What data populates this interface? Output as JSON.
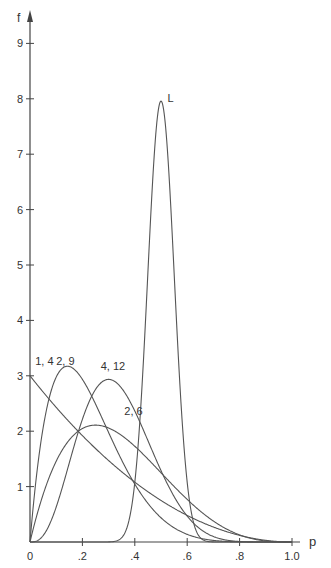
{
  "chart_data": {
    "type": "line",
    "title": "",
    "xlabel": "p",
    "ylabel": "f",
    "xlim": [
      0,
      1.0
    ],
    "ylim": [
      0,
      9.5
    ],
    "grid": false,
    "legend": "inline labels",
    "x_ticks": [
      0,
      0.2,
      0.4,
      0.6,
      0.8,
      1.0
    ],
    "x_tick_labels": [
      "0",
      ".2",
      ".4",
      ".6",
      ".8",
      "1.0"
    ],
    "y_ticks": [
      1,
      2,
      3,
      4,
      5,
      6,
      7,
      8,
      9
    ],
    "y_tick_labels": [
      "1",
      "2",
      "3",
      "4",
      "5",
      "6",
      "7",
      "8",
      "9"
    ],
    "series": [
      {
        "name": "1, 4",
        "distribution": "beta",
        "alpha": 1,
        "beta": 3,
        "label_pos": [
          0.02,
          3.2
        ],
        "x": [
          0,
          0.1,
          0.2,
          0.3,
          0.4,
          0.5,
          0.6,
          0.7,
          0.8,
          0.9,
          1.0
        ],
        "values": [
          3.0,
          2.43,
          1.92,
          1.47,
          1.08,
          0.75,
          0.48,
          0.27,
          0.12,
          0.03,
          0
        ]
      },
      {
        "name": "2, 9",
        "distribution": "beta",
        "alpha": 2,
        "beta": 7,
        "label_pos": [
          0.1,
          3.2
        ],
        "x": [
          0,
          0.1,
          0.2,
          0.3,
          0.4,
          0.5,
          0.6,
          0.7,
          0.8
        ],
        "values": [
          0,
          3.02,
          2.1,
          0.94,
          0.3,
          0.06,
          0.01,
          0,
          0
        ]
      },
      {
        "name": "4, 12",
        "distribution": "beta",
        "alpha": 4,
        "beta": 8,
        "label_pos": [
          0.27,
          3.1
        ],
        "x": [
          0,
          0.1,
          0.2,
          0.3,
          0.4,
          0.5,
          0.6,
          0.7,
          0.8
        ],
        "values": [
          0,
          0.63,
          2.21,
          2.93,
          2.21,
          1.06,
          0.35,
          0.06,
          0
        ]
      },
      {
        "name": "2, 6",
        "distribution": "beta",
        "alpha": 2,
        "beta": 4,
        "label_pos": [
          0.36,
          2.3
        ],
        "x": [
          0,
          0.1,
          0.2,
          0.3,
          0.4,
          0.5,
          0.6,
          0.7,
          0.8,
          0.9,
          1.0
        ],
        "values": [
          0,
          1.46,
          2.05,
          2.06,
          1.73,
          1.25,
          0.77,
          0.38,
          0.13,
          0.02,
          0
        ]
      },
      {
        "name": "L",
        "distribution": "beta",
        "alpha": 50,
        "beta": 50,
        "label_pos": [
          0.525,
          7.95
        ],
        "x": [
          0.35,
          0.4,
          0.45,
          0.5,
          0.55,
          0.6,
          0.65
        ],
        "values": [
          0.09,
          1.07,
          4.87,
          7.96,
          4.87,
          1.07,
          0.09
        ]
      }
    ]
  }
}
